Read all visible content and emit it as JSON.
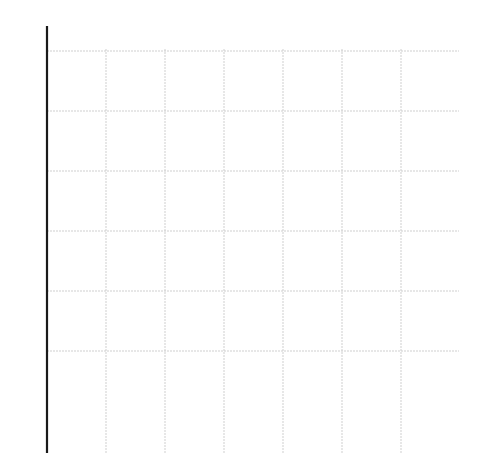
{
  "diagram": {
    "title": "",
    "grid": {
      "columns": 7,
      "rows": 7,
      "origin_px": [
        47,
        411
      ],
      "step_px": [
        59,
        60
      ]
    },
    "axes": {
      "x_arrow": true,
      "y_arrow": true
    },
    "points": [
      {
        "id": "p0",
        "label": "p",
        "sub": "0",
        "x": 0,
        "y": 5
      },
      {
        "id": "p1",
        "label": "p",
        "sub": "1",
        "x": 1,
        "y": 4
      },
      {
        "id": "p2",
        "label": "p",
        "sub": "2",
        "x": 2,
        "y": 3
      },
      {
        "id": "p3",
        "label": "p",
        "sub": "3",
        "x": 3,
        "y": 2
      },
      {
        "id": "p4",
        "label": "p",
        "sub": "4",
        "x": 4,
        "y": 1
      },
      {
        "id": "p5",
        "label": "p",
        "sub": "5",
        "x": 5,
        "y": 0
      }
    ],
    "a_nodes": [
      {
        "i": 0,
        "j": 1,
        "label": "a",
        "sub": "0,1"
      },
      {
        "i": 0,
        "j": 2,
        "label": "a",
        "sub": "0,2"
      },
      {
        "i": 0,
        "j": 3,
        "label": "a",
        "sub": "0,3"
      },
      {
        "i": 0,
        "j": 4,
        "label": "a",
        "sub": "0,4"
      },
      {
        "i": 0,
        "j": 5,
        "label": "a",
        "sub": "0,5"
      },
      {
        "i": 1,
        "j": 2,
        "label": "a",
        "sub": "1,2"
      },
      {
        "i": 1,
        "j": 3,
        "label": "a",
        "sub": "1,3"
      },
      {
        "i": 1,
        "j": 4,
        "label": "a",
        "sub": "1,4"
      },
      {
        "i": 1,
        "j": 5,
        "label": "a",
        "sub": "1,5"
      },
      {
        "i": 2,
        "j": 3,
        "label": "a",
        "sub": "2,3"
      },
      {
        "i": 2,
        "j": 4,
        "label": "a",
        "sub": "2,4"
      },
      {
        "i": 2,
        "j": 5,
        "label": "a",
        "sub": "2,5"
      },
      {
        "i": 3,
        "j": 4,
        "label": "a",
        "sub": "3,4"
      },
      {
        "i": 3,
        "j": 5,
        "label": "a",
        "sub": "3,5"
      },
      {
        "i": 4,
        "j": 5,
        "label": "a",
        "sub": "4,5"
      }
    ],
    "edge_rule": "each a_{i,j} (at column j, row 5-i) connects to p_i and p_j",
    "colors": {
      "edge": "#9a9a9a",
      "axis": "#1a1a1a",
      "grid": "#cfcfcf",
      "point": "#111111"
    }
  }
}
